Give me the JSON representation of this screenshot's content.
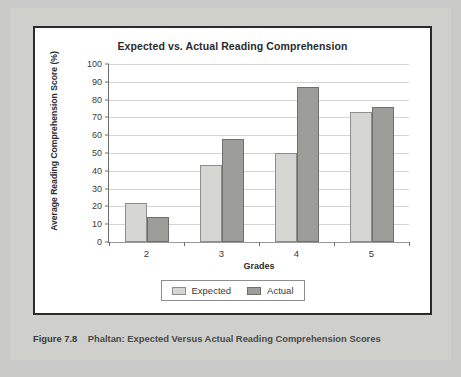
{
  "caption": {
    "figure_number": "Figure 7.8",
    "text": "Phaltan: Expected Versus Actual Reading Comprehension Scores"
  },
  "colors": {
    "expected_fill": "#d6d6d2",
    "actual_fill": "#9d9d99",
    "bar_border": "#8d8d8d",
    "gridline": "#d4d4d4",
    "axis": "#6e6e6e",
    "frame": "#2b2b2b",
    "page_background": "#c9c9c7",
    "plot_background": "#ffffff"
  },
  "chart_data": {
    "type": "bar",
    "title": "Expected vs. Actual Reading Comprehension",
    "xlabel": "Grades",
    "ylabel": "Average Reading Comprehension Score (%)",
    "categories": [
      "2",
      "3",
      "4",
      "5"
    ],
    "series": [
      {
        "name": "Expected",
        "values": [
          22,
          43,
          50,
          73
        ]
      },
      {
        "name": "Actual",
        "values": [
          14,
          58,
          87,
          76
        ]
      }
    ],
    "ylim": [
      0,
      100
    ],
    "ytick_step": 10,
    "yticks": [
      0,
      10,
      20,
      30,
      40,
      50,
      60,
      70,
      80,
      90,
      100
    ],
    "ytick_labels": [
      "0",
      "10",
      "20",
      "30",
      "40",
      "50",
      "60",
      "70",
      "80",
      "90",
      "100"
    ],
    "grid": true,
    "grid_axis": "y",
    "legend": true,
    "legend_position": "bottom",
    "legend_entries": [
      "Expected",
      "Actual"
    ]
  }
}
